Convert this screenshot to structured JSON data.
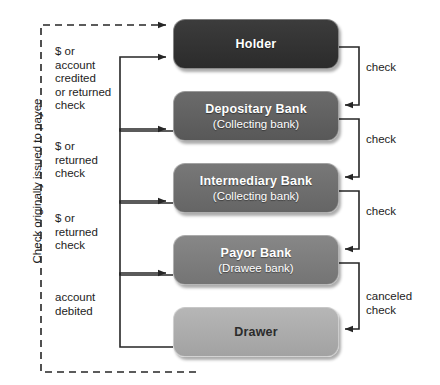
{
  "diagram": {
    "outer_label": "Check originally issued to payee",
    "colors": {
      "holder": "#333333",
      "depositary": "#606060",
      "intermediary": "#6e6e6e",
      "payor": "#7d7d7d",
      "drawer": "#ababab",
      "wire": "#262626",
      "background": "#ffffff"
    },
    "nodes": [
      {
        "id": "holder",
        "title": "Holder",
        "sub": ""
      },
      {
        "id": "depositary",
        "title": "Depositary Bank",
        "sub": "(Collecting bank)"
      },
      {
        "id": "intermediary",
        "title": "Intermediary Bank",
        "sub": "(Collecting bank)"
      },
      {
        "id": "payor",
        "title": "Payor Bank",
        "sub": "(Drawee bank)"
      },
      {
        "id": "drawer",
        "title": "Drawer",
        "sub": ""
      }
    ],
    "left_labels": [
      {
        "id": "l1",
        "text": "$ or\naccount\ncredited\nor returned\ncheck"
      },
      {
        "id": "l2",
        "text": "$ or\nreturned\ncheck"
      },
      {
        "id": "l3",
        "text": "$ or\nreturned\ncheck"
      },
      {
        "id": "l4",
        "text": "account\ndebited"
      }
    ],
    "right_labels": [
      {
        "id": "r1",
        "text": "check"
      },
      {
        "id": "r2",
        "text": "check"
      },
      {
        "id": "r3",
        "text": "check"
      },
      {
        "id": "r4",
        "text": "canceled\ncheck"
      }
    ]
  }
}
